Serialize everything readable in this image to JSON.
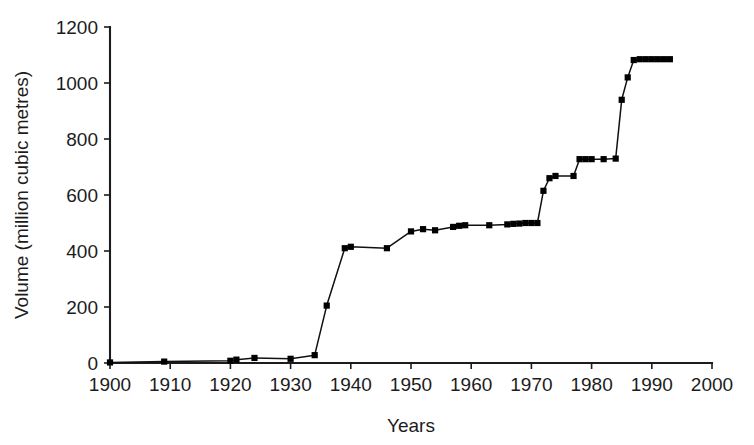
{
  "figure": {
    "background_color": "#ffffff",
    "line_color": "#111111",
    "marker_color": "#000000",
    "axis_color": "#1c1c1c"
  },
  "axes": {
    "x_title": "Years",
    "y_title": "Volume (million cubic metres)",
    "x_ticks": [
      "1900",
      "1910",
      "1920",
      "1930",
      "1940",
      "1950",
      "1960",
      "1970",
      "1980",
      "1990",
      "2000"
    ],
    "y_ticks": [
      "0",
      "200",
      "400",
      "600",
      "800",
      "1000",
      "1200"
    ]
  },
  "chart_data": {
    "type": "line",
    "title": "",
    "subtitle": "",
    "xlabel": "Years",
    "ylabel": "Volume (million cubic metres)",
    "xlim": [
      1900,
      2000
    ],
    "ylim": [
      0,
      1200
    ],
    "xticks": [
      1900,
      1910,
      1920,
      1930,
      1940,
      1950,
      1960,
      1970,
      1980,
      1990,
      2000
    ],
    "yticks": [
      0,
      200,
      400,
      600,
      800,
      1000,
      1200
    ],
    "grid": false,
    "legend": false,
    "legend_position": "none",
    "marker": "square",
    "series": [
      {
        "name": "Cumulative reservoir volume",
        "x": [
          1900,
          1909,
          1920,
          1921,
          1924,
          1930,
          1934,
          1936,
          1939,
          1940,
          1946,
          1950,
          1952,
          1954,
          1957,
          1958,
          1959,
          1963,
          1966,
          1967,
          1968,
          1969,
          1970,
          1971,
          1972,
          1973,
          1974,
          1977,
          1978,
          1979,
          1980,
          1982,
          1984,
          1985,
          1986,
          1987,
          1988,
          1989,
          1990,
          1991,
          1992,
          1993
        ],
        "y": [
          2,
          5,
          8,
          12,
          18,
          15,
          28,
          205,
          410,
          415,
          410,
          470,
          478,
          474,
          486,
          490,
          492,
          492,
          495,
          497,
          498,
          500,
          500,
          500,
          615,
          660,
          668,
          668,
          728,
          728,
          728,
          728,
          730,
          940,
          1020,
          1082,
          1085,
          1085,
          1085,
          1085,
          1085,
          1085
        ]
      }
    ]
  }
}
